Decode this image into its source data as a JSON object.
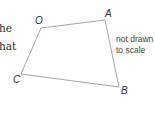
{
  "cut_text": [
    "he",
    "hat"
  ],
  "shape": {
    "name": "quadrilateral OABC",
    "vertices": [
      {
        "label": "O",
        "x": 41,
        "y": 28
      },
      {
        "label": "A",
        "x": 105,
        "y": 20
      },
      {
        "label": "B",
        "x": 119,
        "y": 87
      },
      {
        "label": "C",
        "x": 21,
        "y": 74
      }
    ],
    "stroke_color": "#9a9a9a"
  },
  "labels": {
    "O": "O",
    "A": "A",
    "B": "B",
    "C": "C"
  },
  "note": {
    "line1": "not drawn",
    "line2": "to scale"
  }
}
